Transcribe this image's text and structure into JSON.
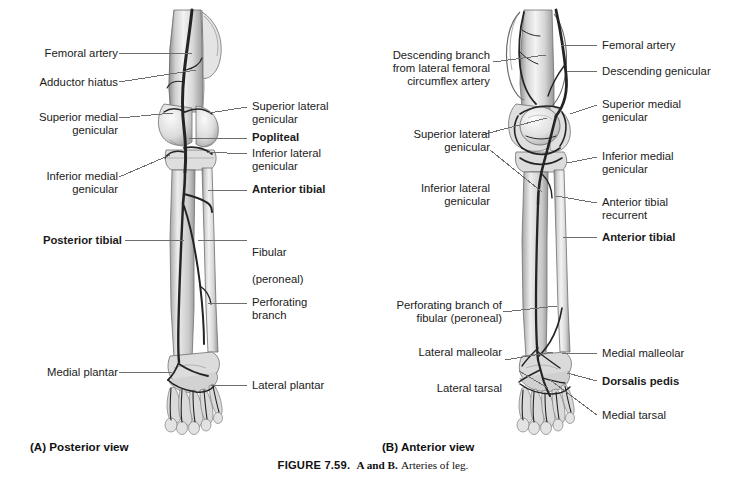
{
  "figure": {
    "number": "FIGURE 7.59.",
    "ab": "A and B.",
    "caption": "Arteries of leg."
  },
  "panels": [
    {
      "id": "A",
      "caption": "(A) Posterior view",
      "view": "Posterior view",
      "labels_left": [
        {
          "text": "Femoral artery",
          "bold": false
        },
        {
          "text": "Adductor hiatus",
          "bold": false
        },
        {
          "text": "Superior medial\ngenicular",
          "bold": false
        },
        {
          "text": "Inferior medial\ngenicular",
          "bold": false
        },
        {
          "text": "Posterior tibial",
          "bold": true
        },
        {
          "text": "Medial plantar",
          "bold": false
        }
      ],
      "labels_right": [
        {
          "text": "Superior lateral\ngenicular",
          "bold": false
        },
        {
          "text": "Popliteal",
          "bold": true
        },
        {
          "text": "Inferior lateral\ngenicular",
          "bold": false
        },
        {
          "text": "Anterior tibial",
          "bold": true
        },
        {
          "text": "Fibular",
          "sub": "(peroneal)",
          "bold": true
        },
        {
          "text": "Perforating\nbranch",
          "bold": false
        },
        {
          "text": "Lateral plantar",
          "bold": false
        }
      ]
    },
    {
      "id": "B",
      "caption": "(B) Anterior view",
      "view": "Anterior view",
      "labels_left": [
        {
          "text": "Descending branch\nfrom lateral femoral\ncircumflex artery",
          "bold": false
        },
        {
          "text": "Superior lateral\ngenicular",
          "bold": false
        },
        {
          "text": "Inferior lateral\ngenicular",
          "bold": false
        },
        {
          "text": "Perforating branch of\nfibular (peroneal)",
          "bold": false
        },
        {
          "text": "Lateral malleolar",
          "bold": false
        },
        {
          "text": "Lateral tarsal",
          "bold": false
        }
      ],
      "labels_right": [
        {
          "text": "Femoral artery",
          "bold": false
        },
        {
          "text": "Descending genicular",
          "bold": false
        },
        {
          "text": "Superior medial\ngenicular",
          "bold": false
        },
        {
          "text": "Inferior medial\ngenicular",
          "bold": false
        },
        {
          "text": "Anterior tibial\nrecurrent",
          "bold": false
        },
        {
          "text": "Anterior tibial",
          "bold": true
        },
        {
          "text": "Medial malleolar",
          "bold": false
        },
        {
          "text": "Dorsalis pedis",
          "bold": true
        },
        {
          "text": "Medial tarsal",
          "bold": false
        }
      ]
    }
  ],
  "colors": {
    "leader": "#6e6e6e",
    "text": "#1b1b1b",
    "background": "#ffffff",
    "bone_light": "#e9e9e9",
    "bone_mid": "#c4c4c4",
    "bone_dark": "#8d8d8d",
    "artery": "#2b2b2b"
  }
}
